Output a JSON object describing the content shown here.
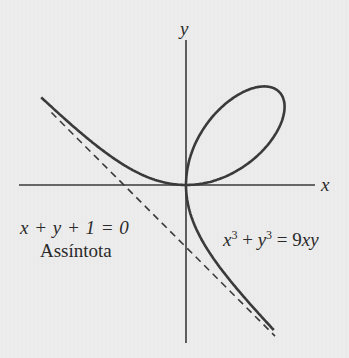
{
  "diagram": {
    "axes": {
      "x_label": "x",
      "y_label": "y",
      "origin_px": [
        186,
        185
      ],
      "x_axis_px": [
        19,
        315
      ],
      "y_axis_px": [
        40,
        343
      ]
    },
    "asymptote": {
      "equation": "x + y + 1 = 0",
      "label": "Assíntota",
      "style": "dashed"
    },
    "curve": {
      "equation_parts": {
        "a": "x",
        "a_exp": "3",
        "plus": " + ",
        "b": "y",
        "b_exp": "3",
        "rest": " = 9",
        "rest_vars": "xy"
      },
      "name": "Folium of Descartes"
    },
    "colors": {
      "background": "#ececec",
      "stroke": "#3a3a3a",
      "text": "#2a2a2a"
    }
  },
  "chart_data": {
    "type": "line",
    "title": "",
    "xlabel": "x",
    "ylabel": "y",
    "series": [
      {
        "name": "x^3 + y^3 = 9xy",
        "kind": "parametric",
        "x": "9t/(1+t^3)",
        "y": "9t^2/(1+t^3)",
        "style": "solid"
      },
      {
        "name": "Assíntota (x + y + 1 = 0)",
        "kind": "line",
        "style": "dashed"
      }
    ],
    "annotations": [
      "x + y + 1 = 0",
      "Assíntota",
      "x^3 + y^3 = 9xy"
    ],
    "grid": false,
    "scale_px_per_unit": 20.7
  }
}
